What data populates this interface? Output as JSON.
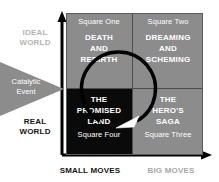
{
  "diagram": {
    "colors": {
      "quadrant_gray": "#8c8c8c",
      "quadrant_black": "#0a0a0a",
      "ideal_world_text": "#b4b4b4",
      "real_world_text": "#141414",
      "small_moves_text": "#141414",
      "big_moves_text": "#a8a8a8",
      "arrow_black": "#000000",
      "arrowhead_white": "#ffffff",
      "triangle_gray": "#8c8c8c"
    },
    "y_axis": {
      "top_label": "IDEAL\nWORLD",
      "top_label_line1": "IDEAL",
      "top_label_line2": "WORLD",
      "bottom_label_line1": "REAL",
      "bottom_label_line2": "WORLD"
    },
    "x_axis": {
      "left_label": "SMALL MOVES",
      "right_label": "BIG MOVES"
    },
    "catalytic": {
      "line1": "Catalytic",
      "line2": "Event"
    },
    "quadrants": [
      {
        "id": "square-one",
        "position": "top-left",
        "number_label": "Square One",
        "number_label_position": "top",
        "title_lines": [
          "DEATH",
          "AND",
          "REBIRTH"
        ],
        "background": "#8c8c8c"
      },
      {
        "id": "square-two",
        "position": "top-right",
        "number_label": "Square Two",
        "number_label_position": "top",
        "title_lines": [
          "DREAMING",
          "AND",
          "SCHEMING"
        ],
        "background": "#8c8c8c"
      },
      {
        "id": "square-four",
        "position": "bottom-left",
        "number_label": "Square Four",
        "number_label_position": "bottom",
        "title_lines": [
          "THE",
          "PROMISED",
          "LAND"
        ],
        "background": "#0a0a0a"
      },
      {
        "id": "square-three",
        "position": "bottom-right",
        "number_label": "Square Three",
        "number_label_position": "bottom",
        "title_lines": [
          "THE",
          "HERO'S",
          "SAGA"
        ],
        "background": "#8c8c8c"
      }
    ]
  }
}
